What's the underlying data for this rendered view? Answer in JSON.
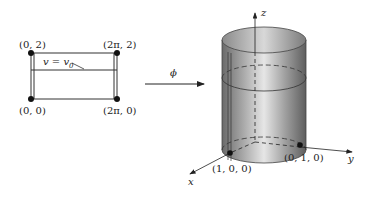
{
  "domain_figure": {
    "left_panel": {
      "corner_labels": {
        "top_left": "(0, 2)",
        "top_right": "(2π, 2)",
        "bottom_left": "(0, 0)",
        "bottom_right": "(2π, 0)"
      },
      "line_label": "v = v",
      "line_label_sub": "0"
    },
    "mapping": {
      "label": "ϕ"
    },
    "right_panel": {
      "axis_labels": {
        "x": "x",
        "y": "y",
        "z": "z"
      },
      "point_labels": {
        "x_point": "(1, 0, 0)",
        "y_point": "(0, 1, 0)"
      }
    }
  }
}
